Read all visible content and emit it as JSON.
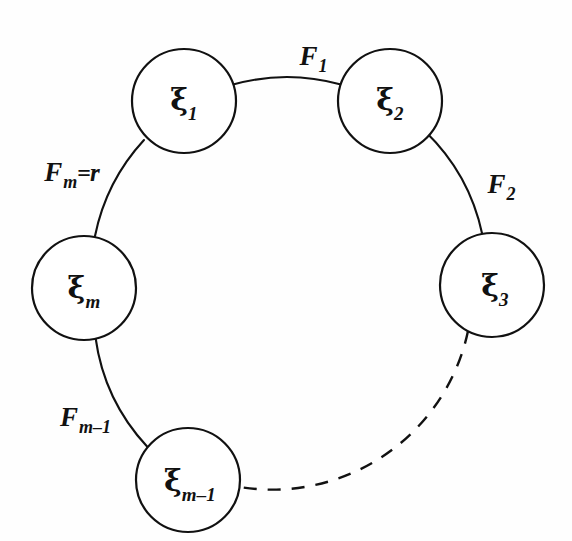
{
  "figure": {
    "kind": "cycle-graph-diagram",
    "background_color": "#fefefe",
    "stroke_color": "#111111",
    "canvas": {
      "width": 572,
      "height": 541
    },
    "ring": {
      "cx": 288,
      "cy": 290,
      "radius": 200
    }
  },
  "nodes": [
    {
      "id": "xi-1",
      "symbol": "ξ",
      "subscript": "1",
      "cx": 184,
      "cy": 101,
      "r": 52
    },
    {
      "id": "xi-2",
      "symbol": "ξ",
      "subscript": "2",
      "cx": 390,
      "cy": 101,
      "r": 52
    },
    {
      "id": "xi-3",
      "symbol": "ξ",
      "subscript": "3",
      "cx": 492,
      "cy": 285,
      "r": 52
    },
    {
      "id": "xi-m-minus-1",
      "symbol": "ξ",
      "subscript": "m–1",
      "cx": 188,
      "cy": 480,
      "r": 52
    },
    {
      "id": "xi-m",
      "symbol": "ξ",
      "subscript": "m",
      "cx": 84,
      "cy": 288,
      "r": 52
    }
  ],
  "edges": [
    {
      "id": "edge-F1",
      "from": "xi-1",
      "to": "xi-2",
      "style": "solid",
      "label": {
        "symbol": "F",
        "subscript": "1",
        "suffix": "",
        "x": 313,
        "y": 56
      }
    },
    {
      "id": "edge-F2",
      "from": "xi-2",
      "to": "xi-3",
      "style": "solid",
      "label": {
        "symbol": "F",
        "subscript": "2",
        "suffix": "",
        "x": 499,
        "y": 184
      }
    },
    {
      "id": "edge-dashed",
      "from": "xi-3",
      "to": "xi-m-minus-1",
      "style": "dashed",
      "label": null
    },
    {
      "id": "edge-Fm-minus-1",
      "from": "xi-m-minus-1",
      "to": "xi-m",
      "style": "solid",
      "label": {
        "symbol": "F",
        "subscript": "m–1",
        "suffix": "",
        "x": 85,
        "y": 417
      }
    },
    {
      "id": "edge-Fm",
      "from": "xi-m",
      "to": "xi-1",
      "style": "solid",
      "label": {
        "symbol": "F",
        "subscript": "m",
        "suffix": "= r",
        "x": 72,
        "y": 172
      }
    }
  ],
  "labels": {
    "F1": "F",
    "F1_sub": "1",
    "F2": "F",
    "F2_sub": "2",
    "Fm": "F",
    "Fm_sub": "m",
    "Fm_eq": "=",
    "Fm_r": "r",
    "Fm1": "F",
    "Fm1_sub": "m–1",
    "xi1": "ξ",
    "xi1_sub": "1",
    "xi2": "ξ",
    "xi2_sub": "2",
    "xi3": "ξ",
    "xi3_sub": "3",
    "xim": "ξ",
    "xim_sub": "m",
    "xim1": "ξ",
    "xim1_sub": "m–1"
  }
}
